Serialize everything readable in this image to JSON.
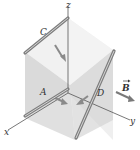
{
  "diagram": {
    "type": "3d-cube-with-rods-in-magnetic-field",
    "axes": {
      "x_label": "x",
      "y_label": "y",
      "z_label": "z"
    },
    "rods": [
      {
        "label": "C",
        "position": "top-left edge, parallel to x-axis at z = top"
      },
      {
        "label": "A",
        "position": "along x-axis"
      },
      {
        "label": "D",
        "position": "diagonal on front-right face"
      }
    ],
    "field": {
      "label": "B",
      "vector": true,
      "direction": "+y"
    },
    "colors": {
      "cube_fill": "#d8d8d8",
      "cube_face_light": "#ececec",
      "rod": "#8a8a8a",
      "rod_highlight": "#d0d0d0",
      "axis": "#555555",
      "arrow": "#7a7a7a"
    }
  }
}
